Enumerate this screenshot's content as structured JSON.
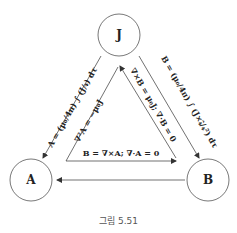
{
  "nodes": {
    "J": {
      "label": "J"
    },
    "A": {
      "label": "A"
    },
    "B": {
      "label": "B"
    }
  },
  "edges": {
    "J_to_A": {
      "label": "A = (μ₀/4π) ∫ (J/𝓇) dτ"
    },
    "J_to_B": {
      "label": "B = (μ₀/4π) ∫ (J×𝓇̂/𝓇²) dτ"
    },
    "B_to_A": {
      "label": ""
    },
    "A_to_J": {
      "label": "∇²A = −μ₀J"
    },
    "B_to_J": {
      "label": "∇×B = μ₀J; ∇·B = 0"
    },
    "A_to_B": {
      "label": "B = ∇×A; ∇·A = 0"
    }
  },
  "caption": "그림 5.51",
  "colors": {
    "line": "#333333",
    "text": "#222222",
    "caption": "#555555"
  }
}
